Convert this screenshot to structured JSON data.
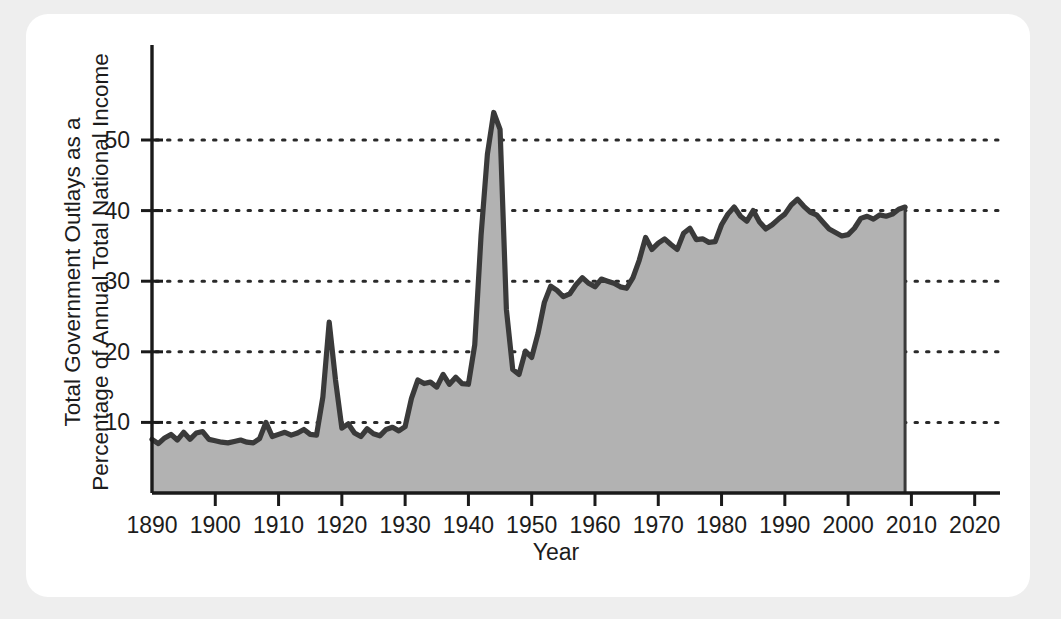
{
  "figure": {
    "background": "#eeeeee",
    "card_background": "#ffffff"
  },
  "chart_data": {
    "type": "area",
    "title": "",
    "xlabel": "Year",
    "ylabel": "Total Government Outlays as a Percentage of Annual Total National Income",
    "ylabel_line1": "Total Government Outlays as a",
    "ylabel_line2": "Percentage of Annual Total National Income",
    "xlim": [
      1890,
      2024
    ],
    "ylim": [
      0,
      58
    ],
    "xticks": [
      1890,
      1900,
      1910,
      1920,
      1930,
      1940,
      1950,
      1960,
      1970,
      1980,
      1990,
      2000,
      2010,
      2020
    ],
    "xtick_labels": [
      "1890",
      "1900",
      "1910",
      "1920",
      "1930",
      "1940",
      "1950",
      "1960",
      "1970",
      "1980",
      "1990",
      "2000",
      "2010",
      "2020"
    ],
    "yticks": [
      10,
      20,
      30,
      40,
      50
    ],
    "ytick_labels": [
      "10",
      "20",
      "30",
      "40",
      "50"
    ],
    "grid": "horizontal-dotted",
    "legend": "none",
    "series_name": "Total Government Outlays as a Percentage of Annual Total National Income",
    "fill_color": "#b2b2b2",
    "line_color": "#3a3a3a",
    "axis_color": "#1a1a1a",
    "grid_color": "#2a2a2a",
    "x": [
      1890,
      1891,
      1892,
      1893,
      1894,
      1895,
      1896,
      1897,
      1898,
      1899,
      1900,
      1901,
      1902,
      1903,
      1904,
      1905,
      1906,
      1907,
      1908,
      1909,
      1910,
      1911,
      1912,
      1913,
      1914,
      1915,
      1916,
      1917,
      1918,
      1919,
      1920,
      1921,
      1922,
      1923,
      1924,
      1925,
      1926,
      1927,
      1928,
      1929,
      1930,
      1931,
      1932,
      1933,
      1934,
      1935,
      1936,
      1937,
      1938,
      1939,
      1940,
      1941,
      1942,
      1943,
      1944,
      1945,
      1946,
      1947,
      1948,
      1949,
      1950,
      1951,
      1952,
      1953,
      1954,
      1955,
      1956,
      1957,
      1958,
      1959,
      1960,
      1961,
      1962,
      1963,
      1964,
      1965,
      1966,
      1967,
      1968,
      1969,
      1970,
      1971,
      1972,
      1973,
      1974,
      1975,
      1976,
      1977,
      1978,
      1979,
      1980,
      1981,
      1982,
      1983,
      1984,
      1985,
      1986,
      1987,
      1988,
      1989,
      1990,
      1991,
      1992,
      1993,
      1994,
      1995,
      1996,
      1997,
      1998,
      1999,
      2000,
      2001,
      2002,
      2003,
      2004,
      2005,
      2006,
      2007,
      2008,
      2009
    ],
    "values": [
      7.6,
      7.0,
      7.8,
      8.3,
      7.5,
      8.6,
      7.6,
      8.5,
      8.7,
      7.6,
      7.4,
      7.2,
      7.1,
      7.3,
      7.5,
      7.2,
      7.1,
      7.7,
      10.0,
      8.0,
      8.3,
      8.6,
      8.2,
      8.5,
      9.0,
      8.3,
      8.2,
      13.6,
      24.2,
      16.0,
      9.2,
      9.8,
      8.5,
      8.0,
      9.1,
      8.4,
      8.1,
      9.0,
      9.3,
      8.8,
      9.4,
      13.4,
      16.0,
      15.5,
      15.7,
      15.0,
      16.8,
      15.4,
      16.4,
      15.5,
      15.4,
      21.0,
      36.5,
      48.0,
      53.9,
      51.5,
      26.0,
      17.5,
      16.8,
      20.1,
      19.2,
      22.6,
      27.0,
      29.3,
      28.7,
      27.8,
      28.2,
      29.5,
      30.5,
      29.7,
      29.2,
      30.3,
      30.0,
      29.7,
      29.2,
      29.0,
      30.5,
      33.0,
      36.2,
      34.5,
      35.4,
      36.0,
      35.2,
      34.5,
      36.8,
      37.5,
      35.9,
      36.0,
      35.5,
      35.6,
      38.0,
      39.5,
      40.5,
      39.2,
      38.5,
      40.0,
      38.4,
      37.4,
      38.0,
      38.8,
      39.5,
      40.8,
      41.6,
      40.6,
      39.8,
      39.4,
      38.4,
      37.4,
      36.9,
      36.4,
      36.6,
      37.5,
      38.9,
      39.2,
      38.8,
      39.4,
      39.2,
      39.5,
      40.2,
      40.5
    ]
  },
  "annotations": {
    "x_axis_label": "Year",
    "y_axis_label_line1": "Total Government Outlays as a",
    "y_axis_label_line2": "Percentage of Annual Total National Income"
  }
}
